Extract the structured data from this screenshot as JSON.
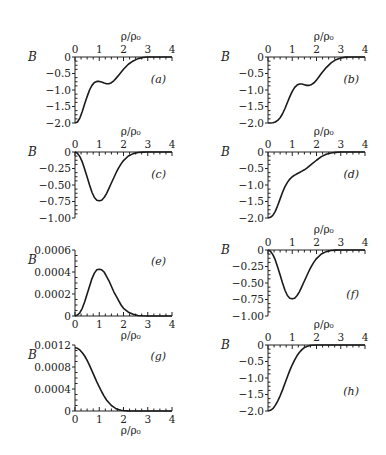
{
  "figure": {
    "width": 386,
    "height": 455,
    "line_color": "#1a1a1a",
    "axis_color": "#222222"
  },
  "chart_data": [
    {
      "id": "a",
      "panel_label": "(a)",
      "type": "line",
      "xlabel": "ρ/ρ₀",
      "ylabel": "B",
      "xlim": [
        0,
        4
      ],
      "ylim": [
        -2.0,
        0
      ],
      "x_ticks": [
        "0",
        "1",
        "2",
        "3",
        "4"
      ],
      "y_ticks": [
        {
          "v": 0,
          "t": "0"
        },
        {
          "v": -0.5,
          "t": "−0.5"
        },
        {
          "v": -1.0,
          "t": "−1.0"
        },
        {
          "v": -1.5,
          "t": "−1.5"
        },
        {
          "v": -2.0,
          "t": "−2.0"
        }
      ],
      "xaxis_position": "top",
      "x": [
        0,
        0.1,
        0.2,
        0.3,
        0.4,
        0.5,
        0.6,
        0.7,
        0.8,
        0.9,
        1.0,
        1.1,
        1.2,
        1.3,
        1.4,
        1.5,
        1.6,
        1.7,
        1.8,
        1.9,
        2.0,
        2.2,
        2.4,
        2.6,
        2.8,
        3.0,
        3.2,
        3.6,
        4.0
      ],
      "y": [
        -2.0,
        -1.97,
        -1.85,
        -1.65,
        -1.42,
        -1.2,
        -1.0,
        -0.86,
        -0.77,
        -0.74,
        -0.74,
        -0.76,
        -0.79,
        -0.81,
        -0.81,
        -0.78,
        -0.72,
        -0.64,
        -0.55,
        -0.46,
        -0.37,
        -0.22,
        -0.12,
        -0.05,
        -0.015,
        0,
        0,
        0,
        0
      ],
      "frame": {
        "x0": 75,
        "x1": 172,
        "y_top": 57,
        "y_bot": 123
      }
    },
    {
      "id": "b",
      "panel_label": "(b)",
      "type": "line",
      "xlabel": "ρ/ρ₀",
      "ylabel": "B",
      "xlim": [
        0,
        4
      ],
      "ylim": [
        -2.0,
        0
      ],
      "x_ticks": [
        "0",
        "1",
        "2",
        "3",
        "4"
      ],
      "y_ticks": [
        {
          "v": 0,
          "t": "0"
        },
        {
          "v": -0.5,
          "t": "−0.5"
        },
        {
          "v": -1.0,
          "t": "−1.0"
        },
        {
          "v": -1.5,
          "t": "−1.5"
        },
        {
          "v": -2.0,
          "t": "−2.0"
        }
      ],
      "xaxis_position": "top",
      "x": [
        0,
        0.1,
        0.2,
        0.3,
        0.4,
        0.5,
        0.6,
        0.7,
        0.8,
        0.9,
        1.0,
        1.1,
        1.2,
        1.3,
        1.4,
        1.5,
        1.6,
        1.7,
        1.8,
        1.9,
        2.0,
        2.1,
        2.2,
        2.4,
        2.6,
        2.8,
        3.0,
        3.2,
        3.4,
        3.6,
        4.0
      ],
      "y": [
        -2.0,
        -2.0,
        -1.99,
        -1.97,
        -1.92,
        -1.84,
        -1.72,
        -1.56,
        -1.38,
        -1.2,
        -1.04,
        -0.92,
        -0.85,
        -0.82,
        -0.82,
        -0.84,
        -0.86,
        -0.86,
        -0.83,
        -0.78,
        -0.7,
        -0.6,
        -0.5,
        -0.32,
        -0.18,
        -0.08,
        -0.03,
        -0.005,
        0,
        0,
        0
      ],
      "frame": {
        "x0": 268,
        "x1": 365,
        "y_top": 57,
        "y_bot": 123
      }
    },
    {
      "id": "c",
      "panel_label": "(c)",
      "type": "line",
      "xlabel": "ρ/ρ₀",
      "ylabel": "B",
      "xlim": [
        0,
        4
      ],
      "ylim": [
        -1.0,
        0
      ],
      "x_ticks": [
        "0",
        "1",
        "2",
        "3",
        "4"
      ],
      "y_ticks": [
        {
          "v": 0,
          "t": "0"
        },
        {
          "v": -0.25,
          "t": "−0.25"
        },
        {
          "v": -0.5,
          "t": "−0.50"
        },
        {
          "v": -0.75,
          "t": "−0.75"
        },
        {
          "v": -1.0,
          "t": "−1.00"
        }
      ],
      "xaxis_position": "top",
      "x": [
        0,
        0.1,
        0.2,
        0.3,
        0.4,
        0.5,
        0.6,
        0.7,
        0.8,
        0.9,
        1.0,
        1.1,
        1.2,
        1.3,
        1.4,
        1.5,
        1.6,
        1.7,
        1.8,
        1.9,
        2.0,
        2.2,
        2.4,
        2.6,
        2.8,
        3.0,
        3.5,
        4.0
      ],
      "y": [
        0,
        -0.02,
        -0.07,
        -0.15,
        -0.26,
        -0.38,
        -0.5,
        -0.61,
        -0.69,
        -0.73,
        -0.74,
        -0.73,
        -0.69,
        -0.63,
        -0.55,
        -0.47,
        -0.39,
        -0.31,
        -0.24,
        -0.18,
        -0.13,
        -0.06,
        -0.025,
        -0.008,
        -0.002,
        0,
        0,
        0
      ],
      "frame": {
        "x0": 75,
        "x1": 172,
        "y_top": 152,
        "y_bot": 218
      }
    },
    {
      "id": "d",
      "panel_label": "(d)",
      "type": "line",
      "xlabel": "ρ/ρ₀",
      "ylabel": "B",
      "xlim": [
        0,
        4
      ],
      "ylim": [
        -2.0,
        0
      ],
      "x_ticks": [
        "0",
        "1",
        "2",
        "3",
        "4"
      ],
      "y_ticks": [
        {
          "v": 0,
          "t": "0"
        },
        {
          "v": -0.5,
          "t": "−0.5"
        },
        {
          "v": -1.0,
          "t": "−1.0"
        },
        {
          "v": -1.5,
          "t": "−1.5"
        },
        {
          "v": -2.0,
          "t": "−2.0"
        }
      ],
      "xaxis_position": "top",
      "x": [
        0,
        0.1,
        0.2,
        0.3,
        0.4,
        0.5,
        0.6,
        0.7,
        0.8,
        0.9,
        1.0,
        1.1,
        1.2,
        1.3,
        1.4,
        1.5,
        1.6,
        1.7,
        1.8,
        2.0,
        2.2,
        2.4,
        2.6,
        2.8,
        3.0,
        3.5,
        4.0
      ],
      "y": [
        -2.0,
        -1.98,
        -1.92,
        -1.8,
        -1.62,
        -1.42,
        -1.22,
        -1.05,
        -0.92,
        -0.82,
        -0.75,
        -0.7,
        -0.66,
        -0.62,
        -0.58,
        -0.54,
        -0.49,
        -0.43,
        -0.37,
        -0.25,
        -0.14,
        -0.07,
        -0.03,
        -0.01,
        0,
        0,
        0
      ],
      "frame": {
        "x0": 268,
        "x1": 365,
        "y_top": 152,
        "y_bot": 218
      }
    },
    {
      "id": "e",
      "panel_label": "(e)",
      "type": "line",
      "xlabel": "ρ/ρ₀",
      "ylabel": "B",
      "xlim": [
        0,
        4
      ],
      "ylim": [
        0,
        0.0006
      ],
      "x_ticks": [
        "0",
        "1",
        "2",
        "3",
        "4"
      ],
      "y_ticks": [
        {
          "v": 0.0006,
          "t": "0.0006"
        },
        {
          "v": 0.0004,
          "t": "0.0004"
        },
        {
          "v": 0.0002,
          "t": "0.0002"
        },
        {
          "v": 0,
          "t": "0"
        }
      ],
      "xaxis_position": "bottom",
      "x": [
        0,
        0.1,
        0.2,
        0.3,
        0.4,
        0.5,
        0.6,
        0.7,
        0.8,
        0.9,
        1.0,
        1.1,
        1.2,
        1.3,
        1.4,
        1.5,
        1.6,
        1.7,
        1.8,
        1.9,
        2.0,
        2.2,
        2.4,
        2.6,
        2.8,
        3.0,
        3.5,
        4.0
      ],
      "y": [
        0,
        8e-06,
        3e-05,
        7e-05,
        0.00013,
        0.0002,
        0.00027,
        0.00034,
        0.00039,
        0.00042,
        0.000425,
        0.00042,
        0.0004,
        0.00036,
        0.00032,
        0.00027,
        0.00022,
        0.00018,
        0.00014,
        0.0001,
        7e-05,
        3.5e-05,
        1.5e-05,
        5e-06,
        2e-06,
        0,
        0,
        0
      ],
      "frame": {
        "x0": 75,
        "x1": 172,
        "y_top": 250,
        "y_bot": 316
      }
    },
    {
      "id": "f",
      "panel_label": "(f)",
      "type": "line",
      "xlabel": "ρ/ρ₀",
      "ylabel": "B",
      "xlim": [
        0,
        4
      ],
      "ylim": [
        -1.0,
        0
      ],
      "x_ticks": [
        "0",
        "1",
        "2",
        "3",
        "4"
      ],
      "y_ticks": [
        {
          "v": 0,
          "t": "0"
        },
        {
          "v": -0.25,
          "t": "−0.25"
        },
        {
          "v": -0.5,
          "t": "−0.50"
        },
        {
          "v": -0.75,
          "t": "−0.75"
        },
        {
          "v": -1.0,
          "t": "−1.00"
        }
      ],
      "xaxis_position": "top",
      "x": [
        0,
        0.1,
        0.2,
        0.3,
        0.4,
        0.5,
        0.6,
        0.7,
        0.8,
        0.9,
        1.0,
        1.1,
        1.2,
        1.3,
        1.4,
        1.5,
        1.6,
        1.7,
        1.8,
        1.9,
        2.0,
        2.2,
        2.4,
        2.6,
        2.8,
        3.0,
        3.5,
        4.0
      ],
      "y": [
        0,
        -0.02,
        -0.07,
        -0.15,
        -0.26,
        -0.38,
        -0.5,
        -0.61,
        -0.69,
        -0.73,
        -0.74,
        -0.73,
        -0.69,
        -0.63,
        -0.55,
        -0.47,
        -0.39,
        -0.31,
        -0.24,
        -0.18,
        -0.13,
        -0.06,
        -0.025,
        -0.008,
        -0.002,
        0,
        0,
        0
      ],
      "frame": {
        "x0": 268,
        "x1": 365,
        "y_top": 250,
        "y_bot": 316
      }
    },
    {
      "id": "g",
      "panel_label": "(g)",
      "type": "line",
      "xlabel": "ρ/ρ₀",
      "ylabel": "B",
      "xlim": [
        0,
        4
      ],
      "ylim": [
        0,
        0.0012
      ],
      "x_ticks": [
        "0",
        "1",
        "2",
        "3",
        "4"
      ],
      "y_ticks": [
        {
          "v": 0.0012,
          "t": "0.0012"
        },
        {
          "v": 0.0008,
          "t": "0.0008"
        },
        {
          "v": 0.0004,
          "t": "0.0004"
        },
        {
          "v": 0,
          "t": "0"
        }
      ],
      "xaxis_position": "bottom",
      "x": [
        0,
        0.1,
        0.2,
        0.3,
        0.4,
        0.5,
        0.6,
        0.7,
        0.8,
        0.9,
        1.0,
        1.1,
        1.2,
        1.3,
        1.4,
        1.5,
        1.6,
        1.7,
        1.8,
        1.9,
        2.0,
        2.2,
        2.4,
        2.6,
        3.0,
        3.5,
        4.0
      ],
      "y": [
        0.00115,
        0.00114,
        0.00111,
        0.00106,
        0.001,
        0.00092,
        0.00083,
        0.00073,
        0.00063,
        0.00053,
        0.00044,
        0.00035,
        0.00027,
        0.0002,
        0.00015,
        0.0001,
        7e-05,
        4e-05,
        2.5e-05,
        1.5e-05,
        8e-06,
        2e-06,
        0,
        0,
        0,
        0,
        0
      ],
      "frame": {
        "x0": 75,
        "x1": 172,
        "y_top": 345,
        "y_bot": 411
      }
    },
    {
      "id": "h",
      "panel_label": "(h)",
      "type": "line",
      "xlabel": "ρ/ρ₀",
      "ylabel": "B",
      "xlim": [
        0,
        4
      ],
      "ylim": [
        -2.0,
        0
      ],
      "x_ticks": [
        "0",
        "1",
        "2",
        "3",
        "4"
      ],
      "y_ticks": [
        {
          "v": 0,
          "t": "0"
        },
        {
          "v": -0.5,
          "t": "−0.5"
        },
        {
          "v": -1.0,
          "t": "−1.0"
        },
        {
          "v": -1.5,
          "t": "−1.5"
        },
        {
          "v": -2.0,
          "t": "−2.0"
        }
      ],
      "xaxis_position": "top",
      "x": [
        0,
        0.1,
        0.2,
        0.3,
        0.4,
        0.5,
        0.6,
        0.7,
        0.8,
        0.9,
        1.0,
        1.1,
        1.2,
        1.3,
        1.4,
        1.5,
        1.6,
        1.7,
        1.8,
        2.0,
        2.2,
        2.5,
        3.0,
        4.0
      ],
      "y": [
        -2.0,
        -1.98,
        -1.93,
        -1.83,
        -1.7,
        -1.54,
        -1.36,
        -1.16,
        -0.96,
        -0.77,
        -0.6,
        -0.45,
        -0.32,
        -0.22,
        -0.14,
        -0.08,
        -0.045,
        -0.02,
        -0.008,
        0,
        0,
        0,
        0,
        0
      ],
      "frame": {
        "x0": 268,
        "x1": 365,
        "y_top": 345,
        "y_bot": 411
      }
    }
  ]
}
